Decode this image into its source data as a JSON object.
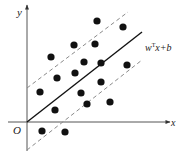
{
  "diagram": {
    "type": "svm-margin-illustration",
    "axes": {
      "x_label": "x",
      "y_label": "y",
      "origin_label": "O",
      "origin": [
        27,
        122
      ],
      "x_end": 170,
      "y_top": 5,
      "y_bottom": 151,
      "x_start": 8
    },
    "hyperplane": {
      "label_w": "w",
      "label_sup": "T",
      "label_rest": "x+b",
      "solid": [
        27,
        122,
        142,
        32
      ],
      "upper_dashed": [
        27,
        88,
        128,
        12
      ],
      "lower_dashed": [
        27,
        150,
        142,
        60
      ]
    },
    "colors": {
      "ink": "#111111",
      "axis": "#555555",
      "dashed": "#8a8a8a"
    },
    "points": [
      [
        97,
        21
      ],
      [
        123,
        27
      ],
      [
        74,
        45
      ],
      [
        95,
        44
      ],
      [
        51,
        57
      ],
      [
        84,
        62
      ],
      [
        101,
        63
      ],
      [
        127,
        65
      ],
      [
        75,
        73
      ],
      [
        57,
        78
      ],
      [
        101,
        82
      ],
      [
        40,
        92
      ],
      [
        81,
        93
      ],
      [
        87,
        104
      ],
      [
        110,
        102
      ],
      [
        55,
        110
      ],
      [
        42,
        131
      ],
      [
        65,
        132
      ]
    ]
  }
}
